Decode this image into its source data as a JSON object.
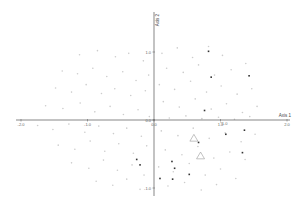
{
  "chart_data": {
    "type": "scatter",
    "title": "",
    "xlabel": "Axis 1",
    "ylabel": "Axis 2",
    "xlim": [
      -2.0,
      2.0
    ],
    "ylim": [
      -1.2,
      1.2
    ],
    "grid": false,
    "legend": null,
    "x_ticks": [
      {
        "value": -2.0,
        "label": "-2.0"
      },
      {
        "value": -1.0,
        "label": "-1.0"
      },
      {
        "value": 0.0,
        "label": "0.0"
      },
      {
        "value": 1.0,
        "label": "1.0"
      },
      {
        "value": 2.0,
        "label": "2.0"
      }
    ],
    "y_ticks": [
      {
        "value": 1.0,
        "label": "1.0"
      },
      {
        "value": 0.0,
        "label": "0.0"
      },
      {
        "value": -1.0,
        "label": "-1.0"
      }
    ],
    "annotations": [
      {
        "text": "*1.0",
        "x": 1.05,
        "y": -0.05
      }
    ],
    "series": [
      {
        "name": "background points",
        "color": "#cccccc",
        "marker": "point",
        "size": 0.8,
        "points": [
          [
            -1.12,
            0.96
          ],
          [
            -0.85,
            1.02
          ],
          [
            -0.58,
            0.93
          ],
          [
            -0.38,
            0.98
          ],
          [
            -0.16,
            0.87
          ],
          [
            -1.38,
            0.72
          ],
          [
            -1.15,
            0.68
          ],
          [
            -0.92,
            0.76
          ],
          [
            -0.71,
            0.64
          ],
          [
            -0.47,
            0.71
          ],
          [
            -0.27,
            0.58
          ],
          [
            -0.08,
            0.66
          ],
          [
            -1.48,
            0.47
          ],
          [
            -1.24,
            0.41
          ],
          [
            -1.02,
            0.52
          ],
          [
            -0.79,
            0.39
          ],
          [
            -0.59,
            0.46
          ],
          [
            -0.35,
            0.36
          ],
          [
            -0.13,
            0.43
          ],
          [
            -1.63,
            0.21
          ],
          [
            -1.37,
            0.17
          ],
          [
            -1.11,
            0.25
          ],
          [
            -0.89,
            0.12
          ],
          [
            -0.66,
            0.2
          ],
          [
            -0.46,
            0.08
          ],
          [
            -0.24,
            0.15
          ],
          [
            -0.07,
            0.05
          ],
          [
            -1.75,
            -0.08
          ],
          [
            -1.52,
            -0.14
          ],
          [
            -1.28,
            -0.06
          ],
          [
            -1.04,
            -0.18
          ],
          [
            -0.83,
            -0.09
          ],
          [
            -0.61,
            -0.2
          ],
          [
            -0.41,
            -0.12
          ],
          [
            -0.19,
            -0.24
          ],
          [
            -1.44,
            -0.37
          ],
          [
            -1.19,
            -0.43
          ],
          [
            -0.96,
            -0.31
          ],
          [
            -0.74,
            -0.46
          ],
          [
            -0.53,
            -0.35
          ],
          [
            -0.31,
            -0.49
          ],
          [
            -0.11,
            -0.38
          ],
          [
            -1.24,
            -0.63
          ],
          [
            -0.98,
            -0.71
          ],
          [
            -0.76,
            -0.59
          ],
          [
            -0.55,
            -0.74
          ],
          [
            -0.33,
            -0.66
          ],
          [
            -0.15,
            -0.81
          ],
          [
            -0.87,
            -0.9
          ],
          [
            -0.62,
            -0.96
          ],
          [
            -0.41,
            -0.87
          ],
          [
            -0.21,
            -1.02
          ],
          [
            0.12,
            0.98
          ],
          [
            0.35,
            1.06
          ],
          [
            0.58,
            0.92
          ],
          [
            0.82,
            1.08
          ],
          [
            1.03,
            0.95
          ],
          [
            0.19,
            0.76
          ],
          [
            0.44,
            0.7
          ],
          [
            0.67,
            0.81
          ],
          [
            0.91,
            0.66
          ],
          [
            1.16,
            0.74
          ],
          [
            1.38,
            0.83
          ],
          [
            0.08,
            0.52
          ],
          [
            0.31,
            0.45
          ],
          [
            0.55,
            0.57
          ],
          [
            0.79,
            0.41
          ],
          [
            1.01,
            0.5
          ],
          [
            1.25,
            0.38
          ],
          [
            1.47,
            0.46
          ],
          [
            0.14,
            0.27
          ],
          [
            0.38,
            0.19
          ],
          [
            0.62,
            0.31
          ],
          [
            0.86,
            0.16
          ],
          [
            1.09,
            0.24
          ],
          [
            1.33,
            0.11
          ],
          [
            1.55,
            0.2
          ],
          [
            0.23,
            0.03
          ],
          [
            0.48,
            0.06
          ],
          [
            0.72,
            0.02
          ],
          [
            0.97,
            0.04
          ],
          [
            1.21,
            0.01
          ],
          [
            1.44,
            0.05
          ],
          [
            0.11,
            -0.16
          ],
          [
            0.36,
            -0.23
          ],
          [
            0.59,
            -0.12
          ],
          [
            0.83,
            -0.27
          ],
          [
            1.07,
            -0.19
          ],
          [
            1.31,
            -0.32
          ],
          [
            1.52,
            -0.21
          ],
          [
            0.17,
            -0.44
          ],
          [
            0.42,
            -0.51
          ],
          [
            0.66,
            -0.39
          ],
          [
            0.9,
            -0.56
          ],
          [
            1.14,
            -0.47
          ],
          [
            1.37,
            -0.58
          ],
          [
            0.07,
            -0.69
          ],
          [
            0.29,
            -0.76
          ],
          [
            0.53,
            -0.64
          ],
          [
            0.77,
            -0.81
          ],
          [
            1.0,
            -0.72
          ],
          [
            1.23,
            -0.86
          ],
          [
            0.21,
            -0.97
          ],
          [
            0.46,
            -0.92
          ],
          [
            0.71,
            -1.03
          ],
          [
            0.94,
            -0.95
          ]
        ]
      },
      {
        "name": "highlighted points",
        "color": "#333333",
        "marker": "square",
        "size": 1.6,
        "points": [
          [
            0.82,
            1.01
          ],
          [
            0.86,
            0.63
          ],
          [
            0.76,
            0.14
          ],
          [
            1.43,
            0.65
          ],
          [
            1.08,
            -0.21
          ],
          [
            1.36,
            -0.15
          ],
          [
            1.33,
            -0.48
          ],
          [
            0.67,
            -0.33
          ],
          [
            -0.26,
            -0.58
          ],
          [
            -0.21,
            -0.66
          ],
          [
            0.27,
            -0.61
          ],
          [
            0.31,
            -0.71
          ],
          [
            0.53,
            -0.8
          ],
          [
            0.09,
            -0.86
          ],
          [
            0.28,
            -0.87
          ]
        ]
      },
      {
        "name": "group centroids",
        "color": "#999999",
        "marker": "triangle-open",
        "size": 4,
        "points": [
          [
            0.6,
            -0.27
          ],
          [
            0.7,
            -0.53
          ]
        ]
      }
    ]
  }
}
